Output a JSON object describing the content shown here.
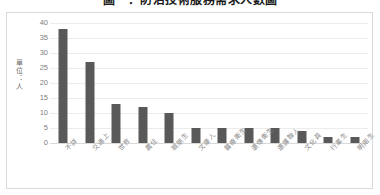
{
  "chart_data": {
    "type": "bar",
    "title": "圖一：防治技術服務需求人數圖",
    "xlabel": "",
    "ylabel": "單位：人",
    "ylim": [
      0,
      40
    ],
    "ytick_labels": [
      "40",
      "35",
      "30",
      "25",
      "20",
      "15",
      "10",
      "5",
      "0"
    ],
    "ytick_values": [
      40,
      35,
      30,
      25,
      20,
      15,
      10,
      5,
      0
    ],
    "grid": true,
    "legend": false,
    "categories": [
      "不詳",
      "交通上",
      "世界",
      "農住",
      "親朋生",
      "文康人",
      "醫療衛生",
      "遺傳衛生",
      "遺護聯人",
      "文化員",
      "行業生",
      "明雨生"
    ],
    "values": [
      38,
      27,
      13,
      12,
      10,
      5,
      5,
      5,
      5,
      4,
      2,
      2
    ],
    "series": [
      {
        "name": "人數",
        "values": [
          38,
          27,
          13,
          12,
          10,
          5,
          5,
          5,
          5,
          4,
          2,
          2
        ]
      }
    ],
    "bar_color": "#595959",
    "plot_background": "#ffffff",
    "border_color": "#d9d9d9",
    "gridline_color": "#ececec",
    "tick_label_color": "#808080"
  }
}
